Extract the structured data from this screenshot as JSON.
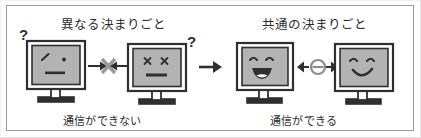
{
  "figure": {
    "kind": "protocol-communication-diagram",
    "background_color": "#ffffff",
    "frame_border_color": "#9b9b9b",
    "ink_color": "#2f2f2f",
    "screen_fill_color": "#b3b3b3",
    "bezel_fill_color": "#ffffff",
    "x_symbol_color": "#9a9a9a",
    "link_symbol_color": "#8c8c8c"
  },
  "titles": {
    "left": "異なる決まりごと",
    "right": "共通の決まりごと"
  },
  "captions": {
    "left": "通信ができない",
    "right": "通信ができる"
  },
  "question_marks": {
    "first": "?",
    "second": "?"
  },
  "monitors": [
    {
      "id": "monitor-1",
      "group": "left",
      "face": "confused",
      "eye_left": "slash",
      "eye_right": "dot",
      "mouth": "flat"
    },
    {
      "id": "monitor-2",
      "group": "left",
      "face": "dead-cross-eyes",
      "eye_left": "cross",
      "eye_right": "cross",
      "mouth": "flat"
    },
    {
      "id": "monitor-3",
      "group": "right",
      "face": "happy-open",
      "eye_left": "arch",
      "eye_right": "arch",
      "mouth": "open-smile"
    },
    {
      "id": "monitor-4",
      "group": "right",
      "face": "happy",
      "eye_left": "arch",
      "eye_right": "arch",
      "mouth": "smile"
    }
  ],
  "connectors": [
    {
      "id": "blocked-link",
      "between": [
        "monitor-1",
        "monitor-2"
      ],
      "symbol": "x",
      "arrows": "both-inward",
      "meaning": "communication blocked"
    },
    {
      "id": "transition-arrow",
      "between": [
        "left-group",
        "right-group"
      ],
      "symbol": "arrow",
      "arrows": "right",
      "meaning": "leads to"
    },
    {
      "id": "established-link",
      "between": [
        "monitor-3",
        "monitor-4"
      ],
      "symbol": "circle-bar",
      "arrows": "both-outward",
      "meaning": "communication established"
    }
  ]
}
